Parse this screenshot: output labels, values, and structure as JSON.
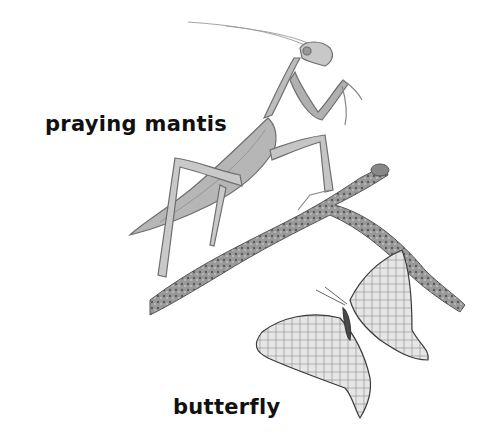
{
  "labels": {
    "mantis": "praying mantis",
    "butterfly": "butterfly"
  },
  "illustration": {
    "subjects": [
      "praying mantis",
      "branch",
      "butterfly"
    ],
    "style": "grayscale pencil drawing"
  }
}
